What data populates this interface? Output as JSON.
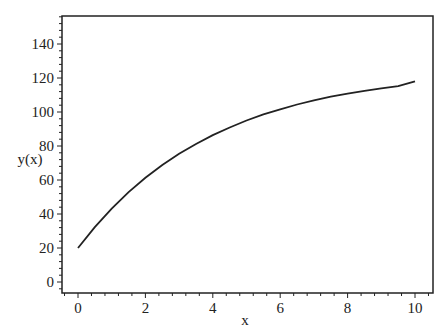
{
  "chart_data": {
    "type": "line",
    "title": "",
    "xlabel": "x",
    "ylabel": "y(x)",
    "xlim": [
      -0.5,
      10.5
    ],
    "ylim": [
      -7,
      157
    ],
    "grid": false,
    "legend": null,
    "x_ticks": [
      0,
      2,
      4,
      6,
      8,
      10
    ],
    "y_ticks": [
      0,
      20,
      40,
      60,
      80,
      100,
      120,
      140
    ],
    "series": [
      {
        "name": "y(x)",
        "color": "#222222",
        "x": [
          0,
          0.5,
          1,
          1.5,
          2,
          2.5,
          3,
          3.5,
          4,
          4.5,
          5,
          5.5,
          6,
          6.5,
          7,
          7.5,
          8,
          8.5,
          9,
          9.5,
          10
        ],
        "values": [
          20,
          32.3,
          43.2,
          52.9,
          61.3,
          68.8,
          75.4,
          81.2,
          86.4,
          90.9,
          95.0,
          98.6,
          101.6,
          104.4,
          106.8,
          109.0,
          110.8,
          112.5,
          113.9,
          115.2,
          118.0
        ]
      }
    ]
  }
}
